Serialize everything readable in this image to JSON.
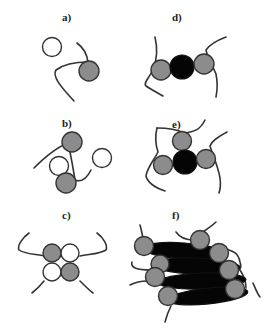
{
  "diagram": {
    "panels": [
      {
        "id": "a",
        "label": "a)",
        "description": "single chain with one gray unit; free white unit nearby"
      },
      {
        "id": "b",
        "label": "b)",
        "description": "two gray units and two white units loosely associated"
      },
      {
        "id": "c",
        "label": "c)",
        "description": "2x2 cluster of gray and white units with four chain ends"
      },
      {
        "id": "d",
        "label": "d)",
        "description": "black core flanked by two gray units"
      },
      {
        "id": "e",
        "label": "e)",
        "description": "black core surrounded by three gray units"
      },
      {
        "id": "f",
        "label": "f)",
        "description": "stacked black elongated cores with gray units on ends"
      }
    ],
    "colors": {
      "gray_unit": "#8c8c8c",
      "white_unit": "#ffffff",
      "black_core": "#050505",
      "chain": "#333333",
      "background": "#ffffff"
    }
  }
}
